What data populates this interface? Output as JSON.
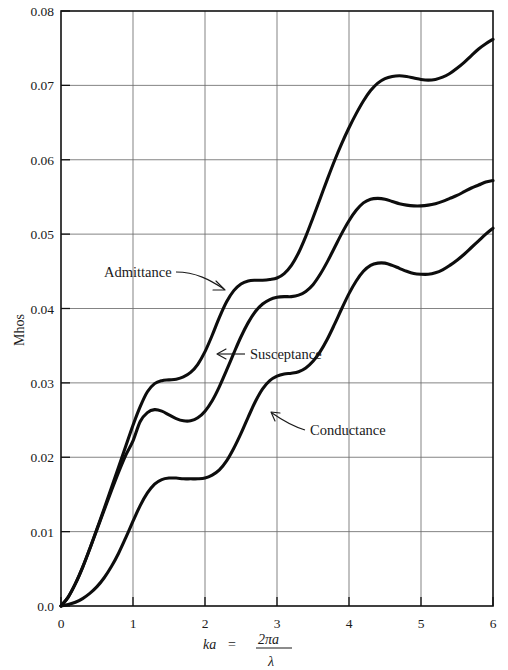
{
  "chart_data": {
    "type": "line",
    "title": "",
    "xlabel": "ka = 2πa/λ",
    "ylabel": "Mhos",
    "xlim": [
      0,
      6
    ],
    "ylim": [
      0,
      0.08
    ],
    "grid": true,
    "legend_position": "inline-annotations",
    "xticks": [
      "0",
      "1",
      "2",
      "3",
      "4",
      "5",
      "6"
    ],
    "xtick_values": [
      0,
      1,
      2,
      3,
      4,
      5,
      6
    ],
    "yticks": [
      "0.0",
      "0.01",
      "0.02",
      "0.03",
      "0.04",
      "0.05",
      "0.06",
      "0.07",
      "0.08"
    ],
    "ytick_values": [
      0.0,
      0.01,
      0.02,
      0.03,
      0.04,
      0.05,
      0.06,
      0.07,
      0.08
    ],
    "x": [
      0.0,
      0.1,
      0.2,
      0.3,
      0.4,
      0.5,
      0.6,
      0.7,
      0.8,
      0.9,
      1.0,
      1.1,
      1.2,
      1.3,
      1.4,
      1.5,
      1.6,
      1.7,
      1.8,
      1.9,
      2.0,
      2.1,
      2.2,
      2.3,
      2.4,
      2.5,
      2.6,
      2.7,
      2.8,
      2.9,
      3.0,
      3.1,
      3.2,
      3.3,
      3.4,
      3.5,
      3.6,
      3.7,
      3.8,
      3.9,
      4.0,
      4.1,
      4.2,
      4.3,
      4.4,
      4.5,
      4.6,
      4.7,
      4.8,
      4.9,
      5.0,
      5.1,
      5.2,
      5.3,
      5.4,
      5.5,
      5.6,
      5.7,
      5.8,
      5.9,
      6.0
    ],
    "series": [
      {
        "name": "Admittance",
        "values": [
          0.0,
          0.0012,
          0.003,
          0.0052,
          0.0077,
          0.0104,
          0.0131,
          0.0159,
          0.0187,
          0.0215,
          0.0243,
          0.0268,
          0.0288,
          0.0299,
          0.0303,
          0.0304,
          0.0305,
          0.0308,
          0.0314,
          0.0325,
          0.0342,
          0.0364,
          0.0388,
          0.0409,
          0.0424,
          0.0433,
          0.0437,
          0.0438,
          0.0438,
          0.0439,
          0.0441,
          0.0447,
          0.0458,
          0.0475,
          0.0497,
          0.0522,
          0.0548,
          0.0574,
          0.0599,
          0.0622,
          0.0643,
          0.0662,
          0.0679,
          0.0693,
          0.0703,
          0.0709,
          0.0712,
          0.0713,
          0.0712,
          0.071,
          0.0708,
          0.0707,
          0.0708,
          0.0711,
          0.0716,
          0.0723,
          0.0731,
          0.074,
          0.0749,
          0.0756,
          0.0762
        ]
      },
      {
        "name": "Susceptance",
        "values": [
          0.0,
          0.0012,
          0.003,
          0.0052,
          0.0077,
          0.0103,
          0.0129,
          0.0155,
          0.018,
          0.0203,
          0.0222,
          0.0248,
          0.026,
          0.0264,
          0.0262,
          0.0257,
          0.0252,
          0.0249,
          0.0249,
          0.0253,
          0.0262,
          0.0276,
          0.0295,
          0.0317,
          0.034,
          0.0362,
          0.0381,
          0.0396,
          0.0406,
          0.0412,
          0.0415,
          0.0416,
          0.0416,
          0.0418,
          0.0423,
          0.0432,
          0.0446,
          0.0463,
          0.0482,
          0.0501,
          0.0518,
          0.0532,
          0.0542,
          0.0547,
          0.0548,
          0.0547,
          0.0544,
          0.0541,
          0.0539,
          0.0538,
          0.0538,
          0.0539,
          0.0541,
          0.0544,
          0.0548,
          0.0552,
          0.0557,
          0.0562,
          0.0566,
          0.057,
          0.0572
        ]
      },
      {
        "name": "Conductance",
        "values": [
          0.0,
          0.0002,
          0.0005,
          0.001,
          0.0017,
          0.0026,
          0.0038,
          0.0053,
          0.0071,
          0.0092,
          0.0114,
          0.0135,
          0.0152,
          0.0164,
          0.017,
          0.0172,
          0.0172,
          0.0171,
          0.0171,
          0.0171,
          0.0172,
          0.0176,
          0.0183,
          0.0195,
          0.0212,
          0.0232,
          0.0254,
          0.0275,
          0.0292,
          0.0303,
          0.0309,
          0.0312,
          0.0313,
          0.0315,
          0.032,
          0.0329,
          0.0342,
          0.0359,
          0.0379,
          0.04,
          0.042,
          0.0437,
          0.045,
          0.0458,
          0.0461,
          0.0461,
          0.0458,
          0.0454,
          0.045,
          0.0447,
          0.0446,
          0.0446,
          0.0448,
          0.0452,
          0.0458,
          0.0465,
          0.0473,
          0.0482,
          0.0491,
          0.05,
          0.0508
        ]
      }
    ],
    "annotations": [
      {
        "label": "Admittance",
        "series": "Admittance",
        "text_x": 104,
        "text_y": 277
      },
      {
        "label": "Susceptance",
        "series": "Susceptance",
        "text_x": 248,
        "text_y": 358
      },
      {
        "label": "Conductance",
        "series": "Conductance",
        "text_x": 308,
        "text_y": 434
      }
    ],
    "xlabel_parts": {
      "lhs": "ka",
      "equals": "=",
      "numerator": "2πa",
      "denominator": "λ"
    }
  },
  "axis": {
    "ylabel": "Mhos"
  }
}
